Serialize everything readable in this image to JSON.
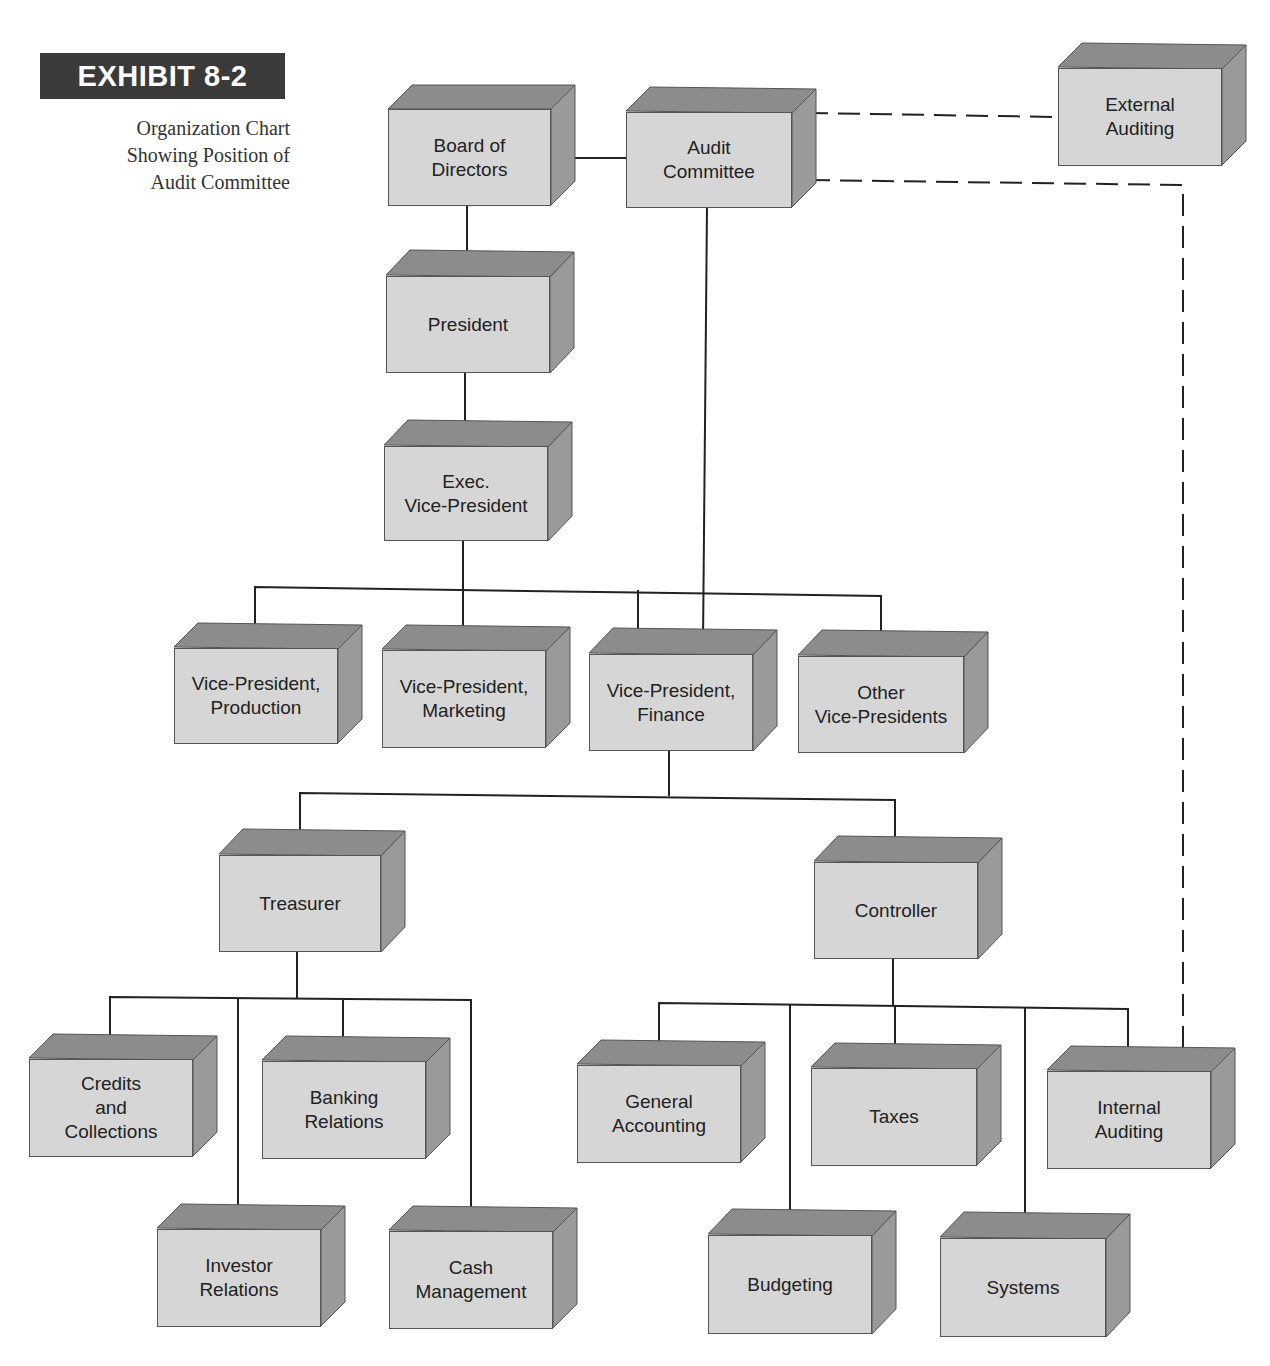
{
  "exhibit": {
    "label": "EXHIBIT 8-2",
    "caption": "Organization Chart\nShowing Position of\nAudit Committee"
  },
  "colors": {
    "face": "#d6d6d6",
    "top": "#8c8c8c",
    "side": "#9a9a9a",
    "line": "#222222",
    "badge_bg": "#3a3a3a",
    "badge_text": "#ffffff"
  },
  "nodes": {
    "board": "Board of\nDirectors",
    "audit_committee": "Audit\nCommittee",
    "external_auditing": "External\nAuditing",
    "president": "President",
    "exec_vp": "Exec.\nVice-President",
    "vp_production": "Vice-President,\nProduction",
    "vp_marketing": "Vice-President,\nMarketing",
    "vp_finance": "Vice-President,\nFinance",
    "other_vps": "Other\nVice-Presidents",
    "treasurer": "Treasurer",
    "controller": "Controller",
    "credits_collections": "Credits\nand\nCollections",
    "banking_relations": "Banking\nRelations",
    "investor_relations": "Investor\nRelations",
    "cash_management": "Cash\nManagement",
    "general_accounting": "General\nAccounting",
    "taxes": "Taxes",
    "internal_auditing": "Internal\nAuditing",
    "budgeting": "Budgeting",
    "systems": "Systems"
  },
  "relationships": {
    "solid": [
      [
        "board",
        "audit_committee"
      ],
      [
        "board",
        "president"
      ],
      [
        "president",
        "exec_vp"
      ],
      [
        "exec_vp",
        "vp_production"
      ],
      [
        "exec_vp",
        "vp_marketing"
      ],
      [
        "exec_vp",
        "vp_finance"
      ],
      [
        "exec_vp",
        "other_vps"
      ],
      [
        "audit_committee",
        "vp_finance"
      ],
      [
        "vp_finance",
        "treasurer"
      ],
      [
        "vp_finance",
        "controller"
      ],
      [
        "treasurer",
        "credits_collections"
      ],
      [
        "treasurer",
        "banking_relations"
      ],
      [
        "treasurer",
        "investor_relations"
      ],
      [
        "treasurer",
        "cash_management"
      ],
      [
        "controller",
        "general_accounting"
      ],
      [
        "controller",
        "taxes"
      ],
      [
        "controller",
        "internal_auditing"
      ],
      [
        "controller",
        "budgeting"
      ],
      [
        "controller",
        "systems"
      ]
    ],
    "dashed": [
      [
        "audit_committee",
        "external_auditing"
      ],
      [
        "audit_committee",
        "internal_auditing"
      ]
    ]
  }
}
